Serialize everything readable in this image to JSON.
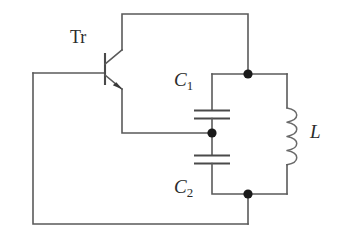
{
  "figure": {
    "name": "colpitts-oscillator-circuit",
    "type": "electronic-circuit-schematic",
    "background_color": "#ffffff",
    "wire_color": "#5a5a5a",
    "node_color": "#1a1a1a",
    "label_color": "#2b2b2b",
    "width": 348,
    "height": 250
  },
  "labels": {
    "transistor": "Tr",
    "capacitor1_letter": "C",
    "capacitor1_sub": "1",
    "capacitor2_letter": "C",
    "capacitor2_sub": "2",
    "inductor": "L"
  },
  "components": [
    {
      "id": "transistor",
      "name": "npn-bipolar-transistor",
      "label": "Tr",
      "terminals": [
        "collector",
        "base",
        "emitter"
      ],
      "arrow_on": "emitter",
      "arrow_direction": "outward"
    },
    {
      "id": "capacitor1",
      "name": "capacitor-c1",
      "label": "C1",
      "orientation": "vertical",
      "plate_count": 2
    },
    {
      "id": "capacitor2",
      "name": "capacitor-c2",
      "label": "C2",
      "orientation": "vertical",
      "plate_count": 2
    },
    {
      "id": "inductor",
      "name": "inductor-l",
      "label": "L",
      "orientation": "vertical",
      "coil_turns": 4
    }
  ],
  "nodes": [
    {
      "id": "node-top-right",
      "x": 248,
      "y": 74
    },
    {
      "id": "node-center-tap",
      "x": 212,
      "y": 133
    },
    {
      "id": "node-bottom-right",
      "x": 248,
      "y": 194
    }
  ],
  "wires": {
    "collector_branch": "from transistor collector up to top rail, right to node-top-right",
    "emitter_branch": "from transistor emitter down, right to node-center-tap",
    "base_branch": "from transistor base left to outer left rail",
    "feedback_loop": "left rail down to bottom rail, right to node-bottom-right"
  }
}
